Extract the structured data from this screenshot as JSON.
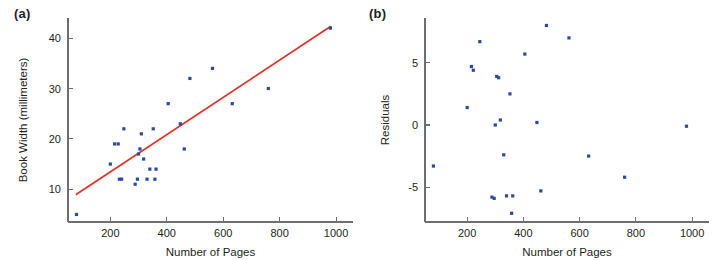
{
  "figure": {
    "background": "#ffffff",
    "point_color": "#2b4a9b",
    "line_color": "#e03127",
    "axis_color": "#6d6e71",
    "text_color": "#231f20"
  },
  "panels": [
    {
      "label": "(a)",
      "name": "scatter-with-regression"
    },
    {
      "label": "(b)",
      "name": "residual-plot"
    }
  ],
  "chart_data": [
    {
      "type": "scatter",
      "title": "(a)",
      "xlabel": "Number of Pages",
      "ylabel": "Book Width (millimeters)",
      "xlim": [
        50,
        1060
      ],
      "ylim": [
        3.5,
        44
      ],
      "grid": false,
      "legend": "none",
      "xticks": [
        200,
        400,
        600,
        800,
        1000
      ],
      "xticklabels": [
        "200",
        "400",
        "600",
        "800",
        "1000"
      ],
      "yticks": [
        10,
        20,
        30,
        40
      ],
      "yticklabels": [
        "10",
        "20",
        "30",
        "40"
      ],
      "x": [
        80,
        200,
        215,
        228,
        232,
        240,
        248,
        288,
        296,
        300,
        305,
        310,
        318,
        330,
        340,
        352,
        358,
        362,
        405,
        448,
        462,
        482,
        562,
        632,
        760,
        980
      ],
      "y": [
        5.0,
        15.0,
        19.0,
        19.0,
        12.0,
        12.0,
        22.0,
        11.0,
        12.0,
        17.0,
        18.0,
        21.0,
        16.0,
        12.0,
        14.0,
        22.0,
        12.0,
        14.0,
        27.0,
        23.0,
        18.0,
        32.0,
        34.0,
        27.0,
        30.0,
        42.0
      ],
      "annotations": [
        {
          "kind": "regression-line",
          "x": [
            80,
            980
          ],
          "y": [
            9.0,
            42.3
          ],
          "color": "#e03127"
        }
      ]
    },
    {
      "type": "scatter",
      "title": "(b)",
      "xlabel": "Number of Pages",
      "ylabel": "Residuals",
      "xlim": [
        50,
        1060
      ],
      "ylim": [
        -7.8,
        8.6
      ],
      "grid": false,
      "legend": "none",
      "xticks": [
        200,
        400,
        600,
        800,
        1000
      ],
      "xticklabels": [
        "200",
        "400",
        "600",
        "800",
        "1000"
      ],
      "yticks": [
        5,
        0,
        -5
      ],
      "yticklabels": [
        "5",
        "0",
        "-5"
      ],
      "x": [
        80,
        200,
        215,
        222,
        245,
        288,
        296,
        300,
        305,
        312,
        318,
        330,
        340,
        352,
        358,
        362,
        405,
        448,
        462,
        482,
        562,
        632,
        760,
        980
      ],
      "y": [
        -3.3,
        1.4,
        4.7,
        4.4,
        6.7,
        -5.8,
        -5.9,
        0.0,
        3.9,
        3.8,
        0.4,
        -2.4,
        -5.7,
        2.5,
        -7.1,
        -5.7,
        5.7,
        0.2,
        -5.3,
        8.0,
        7.0,
        -2.5,
        -4.2,
        -0.1
      ]
    }
  ]
}
